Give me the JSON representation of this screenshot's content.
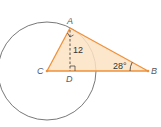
{
  "diagram": {
    "points": {
      "A": {
        "label": "A",
        "x": 70,
        "y": 28
      },
      "B": {
        "label": "B",
        "x": 148,
        "y": 71
      },
      "C": {
        "label": "C",
        "x": 47,
        "y": 71
      },
      "D": {
        "label": "D",
        "x": 70,
        "y": 71
      }
    },
    "circle": {
      "center": "C",
      "radius": 49
    },
    "labels": {
      "altitude_length": "12",
      "angle_B": "28°"
    },
    "colors": {
      "triangle_fill": "#fbe3c4",
      "triangle_stroke": "#f0913a",
      "circle_stroke": "#555555",
      "dashed": "#333333"
    }
  }
}
